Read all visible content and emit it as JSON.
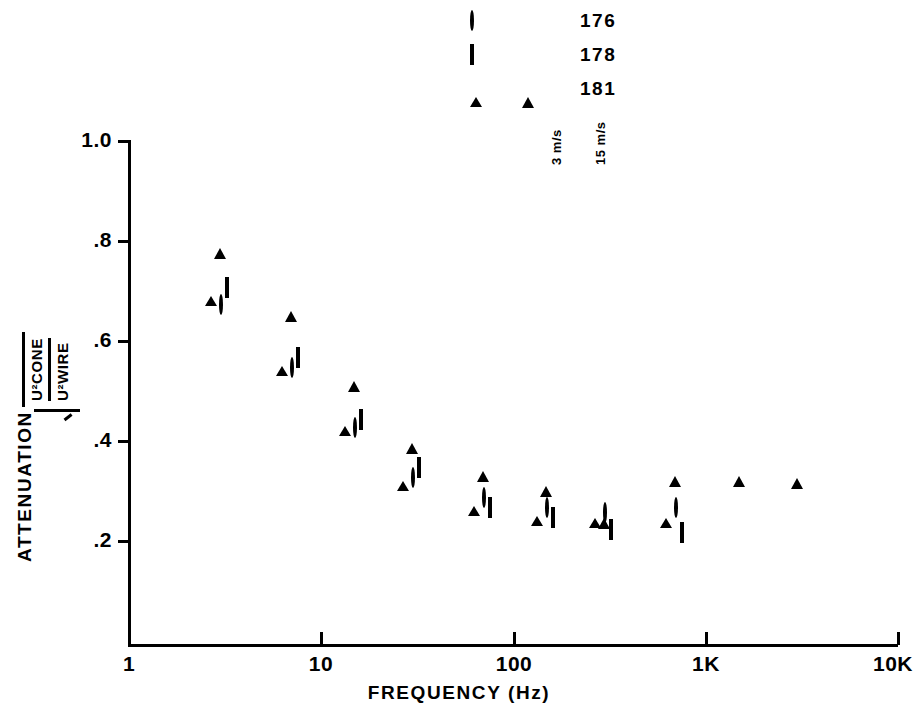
{
  "legend": {
    "rows": [
      {
        "open_marker": "circle-open",
        "filled_marker": "circle-filled",
        "label": "176"
      },
      {
        "open_marker": "square-open",
        "filled_marker": "square-filled",
        "label": "178"
      },
      {
        "open_marker": "triangle-open",
        "filled_marker": "triangle-filled",
        "label": "181"
      }
    ],
    "open_column_label": "3 m/s",
    "filled_column_label": "15 m/s"
  },
  "axes": {
    "y_title_word": "ATTENUATION",
    "y_title_numerator": "U²CONE",
    "y_title_denominator": "U²WIRE",
    "y_ticks": [
      "1.0",
      ".8",
      ".6",
      ".4",
      ".2"
    ],
    "y_tick_values": [
      1.0,
      0.8,
      0.6,
      0.4,
      0.2
    ],
    "x_ticks": [
      "1",
      "10",
      "100",
      "1K",
      "10K"
    ],
    "x_tick_values": [
      1,
      10,
      100,
      1000,
      10000
    ],
    "x_title": "FREQUENCY (Hz)"
  },
  "chart_data": {
    "type": "scatter",
    "title": "",
    "xlabel": "FREQUENCY (Hz)",
    "ylabel": "ATTENUATION  sqrt(U²CONE / U²WIRE)",
    "xscale": "log",
    "xlim": [
      1,
      10000
    ],
    "ylim": [
      0,
      1.0
    ],
    "grid": false,
    "legend_position": "top-right",
    "series": [
      {
        "name": "176 - 3 m/s",
        "marker": "circle-open",
        "fill": "open",
        "speed": "3 m/s",
        "points": [
          {
            "x": 3,
            "y": 0.67
          },
          {
            "x": 7,
            "y": 0.545
          },
          {
            "x": 15,
            "y": 0.425
          },
          {
            "x": 30,
            "y": 0.325
          },
          {
            "x": 70,
            "y": 0.285
          },
          {
            "x": 150,
            "y": 0.265
          },
          {
            "x": 300,
            "y": 0.255
          },
          {
            "x": 700,
            "y": 0.265
          }
        ]
      },
      {
        "name": "178 - 3 m/s",
        "marker": "square-open",
        "fill": "open",
        "speed": "3 m/s",
        "points": [
          {
            "x": 3,
            "y": 0.705
          },
          {
            "x": 7,
            "y": 0.565
          },
          {
            "x": 15,
            "y": 0.44
          },
          {
            "x": 30,
            "y": 0.345
          },
          {
            "x": 70,
            "y": 0.265
          },
          {
            "x": 150,
            "y": 0.245
          },
          {
            "x": 300,
            "y": 0.22
          },
          {
            "x": 700,
            "y": 0.215
          }
        ]
      },
      {
        "name": "181 - 3 m/s",
        "marker": "triangle-open",
        "fill": "open",
        "speed": "3 m/s",
        "points": [
          {
            "x": 3,
            "y": 0.705
          },
          {
            "x": 7,
            "y": 0.565
          },
          {
            "x": 15,
            "y": 0.445
          },
          {
            "x": 30,
            "y": 0.335
          },
          {
            "x": 70,
            "y": 0.285
          },
          {
            "x": 150,
            "y": 0.265
          },
          {
            "x": 300,
            "y": 0.26
          },
          {
            "x": 700,
            "y": 0.26
          }
        ]
      },
      {
        "name": "176 - 15 m/s",
        "marker": "circle-filled",
        "fill": "filled",
        "speed": "15 m/s",
        "points": [
          {
            "x": 3,
            "y": 0.825
          },
          {
            "x": 7,
            "y": 0.69
          },
          {
            "x": 15,
            "y": 0.555
          },
          {
            "x": 30,
            "y": 0.44
          },
          {
            "x": 70,
            "y": 0.385
          },
          {
            "x": 150,
            "y": 0.365
          },
          {
            "x": 300,
            "y": 0.35
          },
          {
            "x": 700,
            "y": 0.305
          },
          {
            "x": 1500,
            "y": 0.31
          },
          {
            "x": 3000,
            "y": 0.32
          }
        ]
      },
      {
        "name": "178 - 15 m/s",
        "marker": "square-filled",
        "fill": "filled",
        "speed": "15 m/s",
        "points": [
          {
            "x": 3,
            "y": 0.81
          },
          {
            "x": 7,
            "y": 0.675
          },
          {
            "x": 15,
            "y": 0.545
          },
          {
            "x": 30,
            "y": 0.425
          },
          {
            "x": 70,
            "y": 0.355
          },
          {
            "x": 150,
            "y": 0.32
          },
          {
            "x": 300,
            "y": 0.315
          },
          {
            "x": 700,
            "y": 0.295
          },
          {
            "x": 1500,
            "y": 0.295
          },
          {
            "x": 3000,
            "y": 0.295
          }
        ]
      },
      {
        "name": "181 - 15 m/s",
        "marker": "triangle-filled",
        "fill": "filled",
        "speed": "15 m/s",
        "points": [
          {
            "x": 3,
            "y": 0.8
          },
          {
            "x": 7,
            "y": 0.675
          },
          {
            "x": 15,
            "y": 0.535
          },
          {
            "x": 30,
            "y": 0.41
          },
          {
            "x": 70,
            "y": 0.355
          },
          {
            "x": 150,
            "y": 0.325
          },
          {
            "x": 300,
            "y": 0.26
          },
          {
            "x": 700,
            "y": 0.345
          },
          {
            "x": 1500,
            "y": 0.345
          },
          {
            "x": 3000,
            "y": 0.34
          }
        ]
      }
    ]
  }
}
